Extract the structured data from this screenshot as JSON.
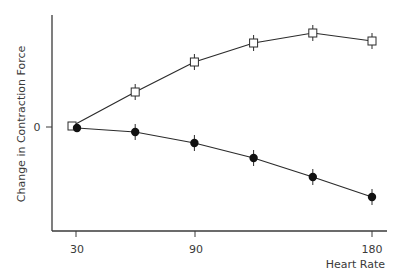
{
  "chart_data": {
    "type": "line",
    "title": "",
    "xlabel": "Heart Rate",
    "ylabel": "Change in Contraction Force",
    "x": [
      30,
      60,
      90,
      120,
      150,
      180
    ],
    "x_ticks": [
      "30",
      "90",
      "180"
    ],
    "y_ticks": [
      "0"
    ],
    "xlim": [
      18,
      188
    ],
    "ylim": [
      -10.4,
      11.2
    ],
    "grid": false,
    "legend": null,
    "series": [
      {
        "name": "open-square",
        "marker": "open-square",
        "values": [
          0.1,
          3.5,
          6.5,
          8.4,
          9.4,
          8.6
        ]
      },
      {
        "name": "filled-circle",
        "marker": "filled-circle",
        "values": [
          -0.1,
          -0.5,
          -1.6,
          -3.1,
          -5.0,
          -7.0
        ]
      }
    ],
    "error_bars": true
  },
  "axis": {
    "x_label": "Heart Rate",
    "y_label": "Change in Contraction Force",
    "x_tick_30": "30",
    "x_tick_90": "90",
    "x_tick_180": "180",
    "y_tick_0": "0"
  },
  "colors": {
    "line": "#2b2b2b",
    "axis": "#3a3a3a",
    "background": "#ffffff"
  }
}
